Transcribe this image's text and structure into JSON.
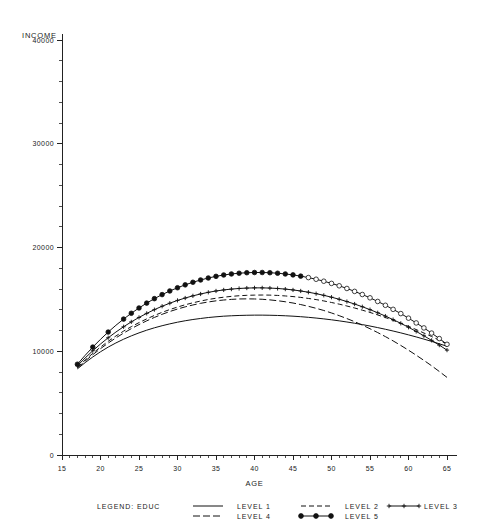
{
  "chart_data": {
    "type": "line",
    "title": "",
    "ylabel": "INCOME",
    "xlabel": "AGE",
    "xlim": [
      15,
      65
    ],
    "ylim": [
      0,
      40000
    ],
    "xticks": [
      "15",
      "20",
      "25",
      "30",
      "35",
      "40",
      "45",
      "50",
      "55",
      "60",
      "65"
    ],
    "yticks": [
      "0",
      "10000",
      "20000",
      "30000",
      "40000"
    ],
    "grid": false,
    "legend_position": "bottom",
    "legend_title": "LEGEND: EDUC",
    "x": [
      17,
      18,
      19,
      20,
      21,
      22,
      23,
      24,
      25,
      26,
      27,
      28,
      29,
      30,
      31,
      32,
      33,
      34,
      35,
      36,
      37,
      38,
      39,
      40,
      41,
      42,
      43,
      44,
      45,
      46,
      47,
      48,
      49,
      50,
      51,
      52,
      53,
      54,
      55,
      56,
      57,
      58,
      59,
      60,
      61,
      62,
      63,
      64,
      65
    ],
    "series": [
      {
        "name": "LEVEL 1",
        "style": "solid",
        "marker": "none",
        "values": [
          8300,
          8900,
          9450,
          9950,
          10400,
          10800,
          11160,
          11480,
          11770,
          12030,
          12260,
          12460,
          12640,
          12800,
          12940,
          13060,
          13160,
          13250,
          13320,
          13380,
          13420,
          13450,
          13470,
          13480,
          13480,
          13470,
          13450,
          13420,
          13380,
          13330,
          13270,
          13200,
          13120,
          13030,
          12930,
          12820,
          12700,
          12570,
          12430,
          12280,
          12120,
          11950,
          11770,
          11580,
          11380,
          11170,
          10950,
          10720,
          10480
        ]
      },
      {
        "name": "LEVEL 2",
        "style": "dashed",
        "marker": "none",
        "values": [
          8450,
          9150,
          9800,
          10400,
          10960,
          11470,
          11940,
          12370,
          12760,
          13120,
          13450,
          13750,
          14020,
          14260,
          14480,
          14670,
          14840,
          14990,
          15110,
          15210,
          15290,
          15350,
          15390,
          15410,
          15420,
          15410,
          15380,
          15330,
          15270,
          15190,
          15090,
          14980,
          14850,
          14700,
          14540,
          14360,
          14170,
          13960,
          13740,
          13500,
          13250,
          12980,
          12700,
          12400,
          12090,
          11760,
          11420,
          11060,
          10690
        ]
      },
      {
        "name": "LEVEL 3",
        "style": "solid",
        "marker": "plus",
        "values": [
          8600,
          9350,
          10050,
          10700,
          11300,
          11850,
          12360,
          12830,
          13260,
          13650,
          14010,
          14340,
          14630,
          14900,
          15130,
          15340,
          15520,
          15680,
          15810,
          15910,
          15990,
          16050,
          16090,
          16110,
          16110,
          16090,
          16050,
          15990,
          15910,
          15810,
          15690,
          15550,
          15390,
          15210,
          15010,
          14790,
          14550,
          14290,
          14010,
          13710,
          13390,
          13050,
          12690,
          12310,
          11910,
          11490,
          11050,
          10590,
          10110
        ]
      },
      {
        "name": "LEVEL 4",
        "style": "dashdot",
        "marker": "none",
        "values": [
          8380,
          9050,
          9670,
          10250,
          10790,
          11290,
          11750,
          12180,
          12570,
          12930,
          13260,
          13560,
          13830,
          14070,
          14280,
          14460,
          14620,
          14750,
          14860,
          14940,
          15000,
          15040,
          15050,
          15040,
          15010,
          14950,
          14870,
          14770,
          14650,
          14500,
          14330,
          14140,
          13930,
          13690,
          13430,
          13150,
          12850,
          12520,
          12170,
          11800,
          11410,
          11000,
          10560,
          10100,
          9620,
          9120,
          8600,
          8050,
          7480
        ]
      },
      {
        "name": "LEVEL 5",
        "style": "solid",
        "marker": "circle",
        "values": [
          8750,
          9600,
          10400,
          11150,
          11850,
          12500,
          13100,
          13660,
          14170,
          14640,
          15070,
          15460,
          15810,
          16120,
          16400,
          16650,
          16870,
          17060,
          17220,
          17350,
          17450,
          17520,
          17570,
          17590,
          17590,
          17570,
          17520,
          17450,
          17360,
          17240,
          17100,
          16940,
          16750,
          16540,
          16310,
          16050,
          15770,
          15470,
          15150,
          14800,
          14430,
          14040,
          13630,
          13190,
          12730,
          12250,
          11750,
          11220,
          10670
        ]
      }
    ]
  },
  "legend": {
    "title": "LEGEND: EDUC",
    "entries": [
      {
        "label": "LEVEL 1",
        "style": "solid",
        "marker": "none"
      },
      {
        "label": "LEVEL 2",
        "style": "dashed",
        "marker": "none"
      },
      {
        "label": "LEVEL 3",
        "style": "solid",
        "marker": "plus"
      },
      {
        "label": "LEVEL 4",
        "style": "dashdot",
        "marker": "none"
      },
      {
        "label": "LEVEL 5",
        "style": "solid",
        "marker": "circle"
      }
    ]
  }
}
